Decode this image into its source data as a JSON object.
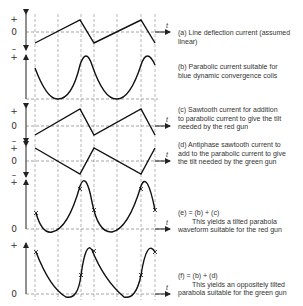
{
  "figure": {
    "axis_label_time": "t",
    "panels": [
      {
        "id": "a",
        "signs": {
          "plus": "+",
          "zero": "0",
          "minus": "–"
        },
        "caption_lines": [
          "(a)   Line deflection current (assumed",
          "linear)"
        ],
        "waveform": "sawtooth-rising"
      },
      {
        "id": "b",
        "signs": {
          "plus": "+",
          "zero": "",
          "minus": ""
        },
        "caption_lines": [
          "(b)   Parabolic current suitable for",
          "blue dynamic convergence coils"
        ],
        "waveform": "parabola"
      },
      {
        "id": "c",
        "signs": {
          "plus": "+",
          "zero": "0",
          "minus": "–"
        },
        "caption_lines": [
          "(c)   Sawtooth current for addition",
          "to parabolic current to give the tilt",
          "needed by the red gun"
        ],
        "waveform": "sawtooth-rising"
      },
      {
        "id": "d",
        "signs": {
          "plus": "+",
          "zero": "0",
          "minus": "–"
        },
        "caption_lines": [
          "(d)   Antiphase sawtooth current to",
          "add to the parabolic current to give",
          "the tilt needed by the green gun"
        ],
        "waveform": "sawtooth-falling"
      },
      {
        "id": "e",
        "signs": {
          "plus": "+",
          "zero": "0",
          "minus": ""
        },
        "caption_lines": [
          "(e)   =   (b)  +  (c)",
          "This yields a tilted parabola",
          "waveform suitable for the red gun"
        ],
        "waveform": "tilted-parabola-red"
      },
      {
        "id": "f",
        "signs": {
          "plus": "+",
          "zero": "0",
          "minus": ""
        },
        "caption_lines": [
          "(f)   =   (b)  +  (d)",
          "This yields an oppositely tilted",
          "parabola suitable for the green gun"
        ],
        "waveform": "tilted-parabola-green"
      }
    ]
  }
}
